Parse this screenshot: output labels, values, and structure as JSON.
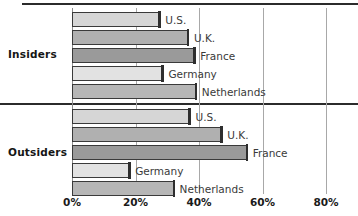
{
  "chart_data": {
    "type": "bar",
    "orientation": "horizontal",
    "title": "",
    "subtitle": "",
    "xlabel": "",
    "ylabel": "",
    "xlim": [
      0,
      80
    ],
    "grid": true,
    "legend_position": "none",
    "xticks": [
      {
        "value": 0,
        "label": "0%"
      },
      {
        "value": 20,
        "label": "20%"
      },
      {
        "value": 40,
        "label": "40%"
      },
      {
        "value": 60,
        "label": "60%"
      },
      {
        "value": 80,
        "label": "80%"
      }
    ],
    "groups": [
      {
        "name": "Insiders",
        "label": "Insiders",
        "bars": [
          {
            "label": "U.S.",
            "value": 27.5,
            "fill": "#d6d6d6"
          },
          {
            "label": "U.K.",
            "value": 36.5,
            "fill": "#b0b0b0"
          },
          {
            "label": "France",
            "value": 38.5,
            "fill": "#9a9a9a"
          },
          {
            "label": "Germany",
            "value": 28.5,
            "fill": "#e2e2e2"
          },
          {
            "label": "Netherlands",
            "value": 39.0,
            "fill": "#b6b6b6"
          }
        ]
      },
      {
        "name": "Outsiders",
        "label": "Outsiders",
        "bars": [
          {
            "label": "U.S.",
            "value": 37.0,
            "fill": "#d6d6d6"
          },
          {
            "label": "U.K.",
            "value": 47.0,
            "fill": "#b0b0b0"
          },
          {
            "label": "France",
            "value": 55.0,
            "fill": "#9a9a9a"
          },
          {
            "label": "Germany",
            "value": 18.0,
            "fill": "#e2e2e2"
          },
          {
            "label": "Netherlands",
            "value": 32.0,
            "fill": "#b6b6b6"
          }
        ]
      }
    ],
    "colors": {
      "bar_outline": "#3a3a3a",
      "cap": "#2e2e2e",
      "gridline": "#a8a8a8",
      "rule": "#2b2b2b",
      "text": "#1a1a1a",
      "background": "#ffffff"
    }
  }
}
